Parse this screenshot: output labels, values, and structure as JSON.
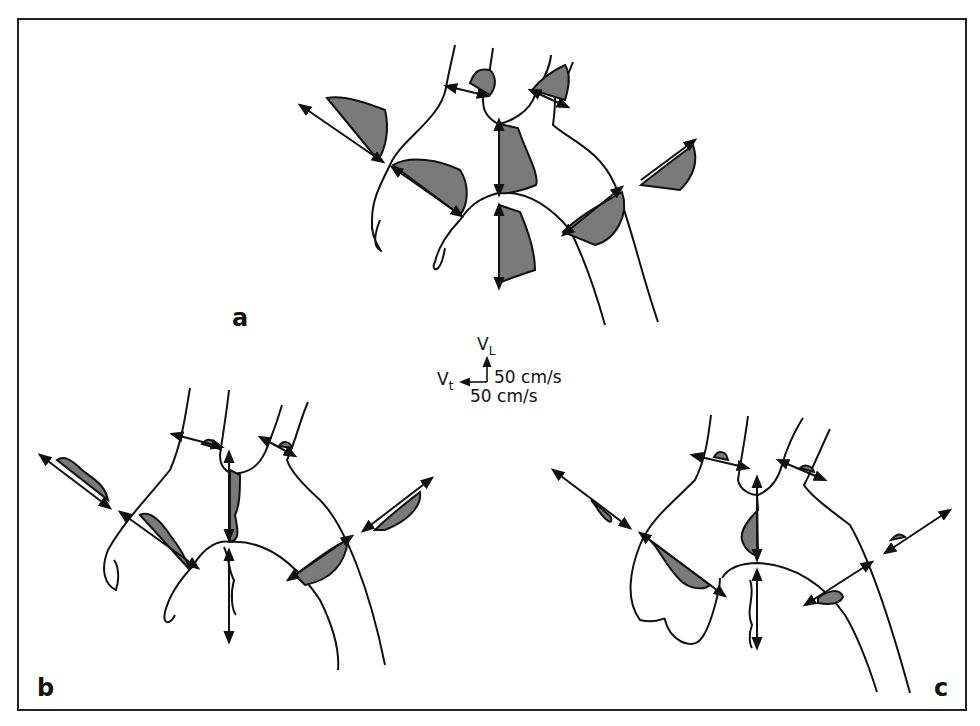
{
  "figure": {
    "panels": [
      {
        "id": "a",
        "label": "a"
      },
      {
        "id": "b",
        "label": "b"
      },
      {
        "id": "c",
        "label": "c"
      }
    ],
    "legend": {
      "vl_symbol": "V",
      "vl_subscript": "L",
      "vt_symbol": "V",
      "vt_subscript": "t",
      "vl_scale": "50 cm/s",
      "vt_scale": "50 cm/s"
    },
    "colors": {
      "profile_fill": "#7a7a7a",
      "stroke": "#111111",
      "border": "#222222",
      "background": "#ffffff"
    }
  }
}
